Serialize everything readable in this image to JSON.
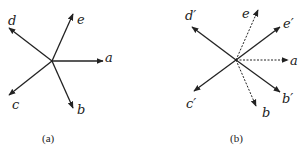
{
  "panels": [
    {
      "caption": "(a)",
      "vectors": [
        {
          "label": "a",
          "style": "solid"
        },
        {
          "label": "b",
          "style": "solid"
        },
        {
          "label": "c",
          "style": "solid"
        },
        {
          "label": "d",
          "style": "solid"
        },
        {
          "label": "e",
          "style": "solid"
        }
      ]
    },
    {
      "caption": "(b)",
      "vectors": [
        {
          "label": "a",
          "style": "dashed"
        },
        {
          "label": "b",
          "style": "dashed"
        },
        {
          "label": "e",
          "style": "dashed"
        },
        {
          "label": "b′",
          "style": "solid"
        },
        {
          "label": "c′",
          "style": "solid"
        },
        {
          "label": "d′",
          "style": "solid"
        },
        {
          "label": "e′",
          "style": "solid"
        }
      ]
    }
  ],
  "colors": {
    "stroke": "#222222",
    "background": "#ffffff"
  }
}
